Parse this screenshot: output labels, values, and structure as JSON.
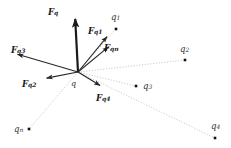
{
  "figure": {
    "background_color": "#ffffff",
    "width": 231,
    "height": 148
  },
  "colors": {
    "vector_stroke": "#262626",
    "resultant_stroke": "#1a1a1a",
    "dotted_line": "#b0b0b0",
    "charge_dot": "#111111",
    "text": "#1a1a1a"
  },
  "origin": {
    "name": "q",
    "label": "q",
    "x": 78,
    "y": 72,
    "label_x": 71,
    "label_y": 80
  },
  "charges": [
    {
      "id": "q1",
      "label": "q",
      "subscript": "1",
      "dot_x": 116,
      "dot_y": 29,
      "label_x": 111,
      "label_y": 13
    },
    {
      "id": "q2",
      "label": "q",
      "subscript": "2",
      "dot_x": 185,
      "dot_y": 60,
      "label_x": 180,
      "label_y": 45
    },
    {
      "id": "q3",
      "label": "q",
      "subscript": "3",
      "dot_x": 136,
      "dot_y": 86,
      "label_x": 143,
      "label_y": 82
    },
    {
      "id": "q4",
      "label": "q",
      "subscript": "4",
      "dot_x": 215,
      "dot_y": 138,
      "label_x": 211,
      "label_y": 122
    },
    {
      "id": "qn",
      "label": "q",
      "subscript": "n",
      "dot_x": 29,
      "dot_y": 129,
      "label_x": 14,
      "label_y": 125
    }
  ],
  "vectors": [
    {
      "id": "Fq",
      "label": "F",
      "subscript": "q",
      "tip_x": 75,
      "tip_y": 15,
      "width": 2.2,
      "label_x": 48,
      "label_y": 8
    },
    {
      "id": "Fq1",
      "label": "F",
      "subscript": "q1",
      "tip_x": 110,
      "tip_y": 33,
      "width": 1.1,
      "label_x": 88,
      "label_y": 27
    },
    {
      "id": "Fqn",
      "label": "F",
      "subscript": "qn",
      "tip_x": 112,
      "tip_y": 44,
      "width": 1.1,
      "label_x": 104,
      "label_y": 44
    },
    {
      "id": "Fq3",
      "label": "F",
      "subscript": "q3",
      "tip_x": 13,
      "tip_y": 53,
      "width": 1.1,
      "label_x": 11,
      "label_y": 46
    },
    {
      "id": "Fq2",
      "label": "F",
      "subscript": "q2",
      "tip_x": 42,
      "tip_y": 79,
      "width": 1.1,
      "label_x": 22,
      "label_y": 80
    },
    {
      "id": "Fq4",
      "label": "F",
      "subscript": "q4",
      "tip_x": 104,
      "tip_y": 88,
      "width": 1.1,
      "label_x": 96,
      "label_y": 94
    }
  ],
  "dotted_lines": [
    {
      "id": "line-q1",
      "to_x": 116,
      "to_y": 29
    },
    {
      "id": "line-q2",
      "to_x": 185,
      "to_y": 60
    },
    {
      "id": "line-q3",
      "to_x": 136,
      "to_y": 86
    },
    {
      "id": "line-q4",
      "to_x": 215,
      "to_y": 138
    },
    {
      "id": "line-qn",
      "to_x": 29,
      "to_y": 129
    }
  ]
}
